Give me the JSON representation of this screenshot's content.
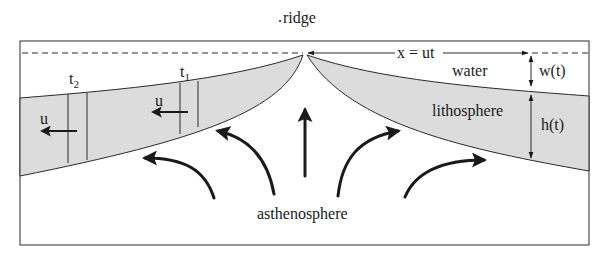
{
  "figure": {
    "type": "cross-section diagram",
    "colors": {
      "lithosphere_fill": "#dcdcdc",
      "line": "#2a2a2a",
      "background": "#ffffff"
    }
  },
  "labels": {
    "ridge": "ridge",
    "distance": "x = ut",
    "water": "water",
    "lithosphere": "lithosphere",
    "asthenosphere": "asthenosphere",
    "water_depth": "w(t)",
    "thickness": "h(t)",
    "velocity_left_1": "u",
    "velocity_left_2": "u",
    "time_1": "t",
    "time_1_sub": "1",
    "time_2": "t",
    "time_2_sub": "2"
  }
}
